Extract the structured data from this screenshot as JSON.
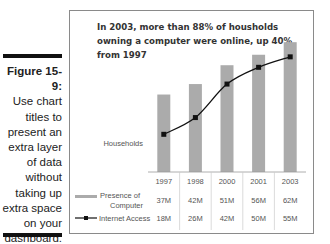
{
  "caption": {
    "figure_label": "Figure 15-9:",
    "lines": [
      "Use chart",
      "titles to",
      "present an",
      "extra layer",
      "of data",
      "without",
      "taking up",
      "extra space",
      "on your",
      "dashboard."
    ]
  },
  "colors": {
    "bar": "#ababab",
    "line": "#111111",
    "frame": "#8a8a8a",
    "rule": "#111111"
  },
  "chart_data": {
    "type": "bar",
    "title": "In 2003, more than 88% of housholds owning a computer were online, up 40% from 1997",
    "ylabel": "Households",
    "xlabel": "",
    "categories": [
      "1997",
      "1998",
      "2000",
      "2001",
      "2003"
    ],
    "series": [
      {
        "name": "Presence of Computer",
        "type": "bar",
        "values": [
          37,
          42,
          51,
          56,
          62
        ],
        "labels": [
          "37M",
          "42M",
          "51M",
          "56M",
          "62M"
        ]
      },
      {
        "name": "Internet Access",
        "type": "line",
        "values": [
          18,
          26,
          42,
          50,
          55
        ],
        "labels": [
          "18M",
          "26M",
          "42M",
          "50M",
          "55M"
        ]
      }
    ],
    "ylim": [
      0,
      64
    ],
    "grid": false,
    "data_table": true,
    "legend_placement": "data-table-left"
  }
}
